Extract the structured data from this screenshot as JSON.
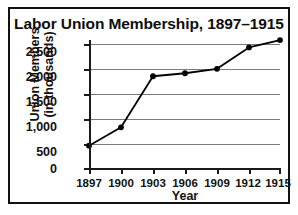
{
  "chart_data": {
    "type": "line",
    "title": "Labor Union Membership, 1897–1915",
    "xlabel": "Year",
    "ylabel": "Union Members (in thousands)",
    "ylabel_line1": "Union Members",
    "ylabel_line2": "(in thousands)",
    "categories": [
      "1897",
      "1900",
      "1903",
      "1906",
      "1909",
      "1912",
      "1915"
    ],
    "x": [
      1897,
      1900,
      1903,
      1906,
      1909,
      1912,
      1915
    ],
    "values": [
      450,
      820,
      1850,
      1910,
      2000,
      2430,
      2580
    ],
    "series": [
      {
        "name": "Union Members (in thousands)",
        "values": [
          450,
          820,
          1850,
          1910,
          2000,
          2430,
          2580
        ]
      }
    ],
    "ylim": [
      0,
      2500
    ],
    "yticks": [
      0,
      500,
      1000,
      1500,
      2000,
      2500
    ],
    "ytick_labels": [
      "0",
      "500",
      "1,000",
      "1,500",
      "2,000",
      "2,500"
    ],
    "xtick_labels": [
      "1897",
      "1900",
      "1903",
      "1906",
      "1909",
      "1912",
      "1915"
    ],
    "grid": true,
    "grid_orientation": "horizontal",
    "legend": false,
    "marker": "circle",
    "line_color": "#000000",
    "marker_color": "#000000",
    "grid_color": "#7b7b7b",
    "axis_color": "#1a1a1a",
    "background_color": "#ffffff",
    "border_color": "#111111"
  }
}
